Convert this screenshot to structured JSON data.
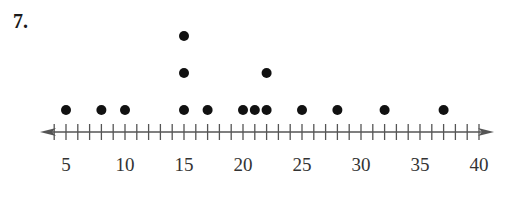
{
  "problem": {
    "number": "7."
  },
  "chart_data": {
    "type": "scatter",
    "subtype": "dot_plot",
    "title": "",
    "xlabel": "",
    "ylabel": "",
    "xlim": [
      5,
      40
    ],
    "axis_range_shown": [
      3,
      41
    ],
    "minor_tick_step": 1,
    "major_ticks": [
      5,
      10,
      15,
      20,
      25,
      30,
      35,
      40
    ],
    "tick_labels": [
      "5",
      "10",
      "15",
      "20",
      "25",
      "30",
      "35",
      "40"
    ],
    "values": [
      5,
      8,
      10,
      15,
      15,
      15,
      17,
      20,
      21,
      22,
      22,
      25,
      28,
      32,
      37
    ],
    "frequencies": {
      "5": 1,
      "8": 1,
      "10": 1,
      "15": 3,
      "17": 1,
      "20": 1,
      "21": 1,
      "22": 2,
      "25": 1,
      "28": 1,
      "32": 1,
      "37": 1
    },
    "grid": false,
    "legend": null,
    "arrows": "both ends"
  },
  "colors": {
    "dot": "#111111",
    "axis": "#555555",
    "label": "#333333"
  }
}
